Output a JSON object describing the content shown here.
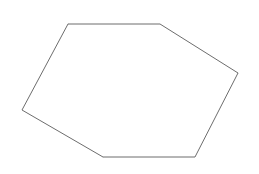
{
  "canvas": {
    "width": 259,
    "height": 174,
    "background_color": "#ffffff",
    "title": "cube-wireframe-drawing"
  },
  "drawing": {
    "type": "line-drawing",
    "subject": "cube",
    "description": "Wireframe outline drawing of a cube seen from above, three visible faces meeting at a central vertex",
    "outline_color": "#6d6d6d",
    "interior_color": "#dcdcdc",
    "outline_width": 1,
    "interior_width": 1.2,
    "vertices": {
      "top_left": {
        "x": 68,
        "y": 24,
        "label": "top-left-corner"
      },
      "top_right": {
        "x": 160,
        "y": 24,
        "label": "top-right-corner"
      },
      "right": {
        "x": 238,
        "y": 73,
        "label": "right-corner"
      },
      "bottom_right": {
        "x": 195,
        "y": 157,
        "label": "bottom-right-corner"
      },
      "bottom_left": {
        "x": 103,
        "y": 157,
        "label": "bottom-left-corner"
      },
      "left": {
        "x": 22,
        "y": 110,
        "label": "left-corner"
      },
      "center": {
        "x": 144,
        "y": 70,
        "label": "center-vertex"
      }
    },
    "silhouette_path": "M 68 24 L 160 24 L 238 73 L 195 157 L 103 157 L 22 110 Z",
    "interior_edges": [
      {
        "name": "center-to-top-left",
        "path": "M 144 70 L 68 24"
      },
      {
        "name": "center-to-right",
        "path": "M 144 70 L 238 73"
      },
      {
        "name": "center-to-bottom-left",
        "path": "M 144 70 L 103 157"
      }
    ],
    "faces": [
      {
        "name": "top-face",
        "path": "M 68 24 L 160 24 L 238 73 L 144 70 Z",
        "fill": "#ffffff"
      },
      {
        "name": "left-face",
        "path": "M 68 24 L 144 70 L 103 157 L 22 110 Z",
        "fill": "#ffffff"
      },
      {
        "name": "right-face",
        "path": "M 144 70 L 238 73 L 195 157 L 103 157 Z",
        "fill": "#ffffff"
      }
    ]
  }
}
